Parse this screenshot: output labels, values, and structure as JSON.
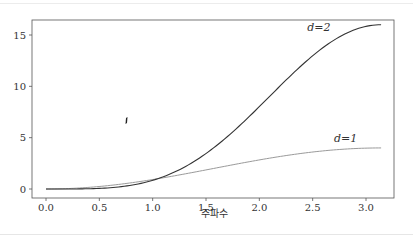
{
  "chart_data": {
    "type": "line",
    "title": "",
    "xlabel": "주파수",
    "ylabel": "",
    "xlim": [
      -0.16,
      3.3
    ],
    "ylim": [
      -0.8,
      16.8
    ],
    "xticks": [
      0.0,
      0.5,
      1.0,
      1.5,
      2.0,
      2.5,
      3.0
    ],
    "xtick_labels": [
      "0.0",
      "0.5",
      "1.0",
      "1.5",
      "2.0",
      "2.5",
      "3.0"
    ],
    "yticks": [
      0,
      5,
      10,
      15
    ],
    "ytick_labels": [
      "0",
      "5",
      "10",
      "15"
    ],
    "grid": false,
    "legend": "none (inline curve labels)",
    "x": [
      0,
      0.25,
      0.5,
      0.75,
      1.0,
      1.25,
      1.5,
      1.75,
      2.0,
      2.25,
      2.5,
      2.75,
      3.0,
      3.1416
    ],
    "series": [
      {
        "name": "d=1",
        "label": "d=1",
        "color": "#9a9a9a",
        "values": [
          0,
          0.062,
          0.245,
          0.537,
          0.919,
          1.369,
          1.859,
          2.356,
          2.832,
          3.256,
          3.602,
          3.849,
          3.98,
          4.0
        ]
      },
      {
        "name": "d=2",
        "label": "d=2",
        "color": "#333333",
        "values": [
          0,
          0.004,
          0.06,
          0.288,
          0.845,
          1.874,
          3.456,
          5.551,
          8.02,
          10.602,
          12.974,
          14.815,
          15.84,
          16.0
        ]
      }
    ],
    "annotations": [
      {
        "text": "d=2",
        "x": 2.45,
        "y": 15.4
      },
      {
        "text": "d=1",
        "x": 2.7,
        "y": 4.6
      }
    ]
  }
}
